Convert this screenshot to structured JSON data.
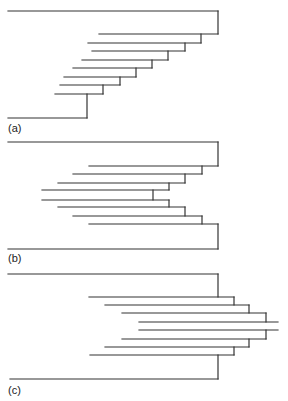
{
  "figure": {
    "stroke_color": "#333333",
    "stroke_width": 1.2,
    "panels": [
      {
        "id": "a",
        "label": "(a)",
        "label_pos": [
          8,
          122
        ],
        "description": "Staircase (pectinate) tree: all branches step down to the left",
        "segments": [
          [
            8,
            11,
            218,
            11
          ],
          [
            218,
            11,
            218,
            34
          ],
          [
            99,
            34,
            218,
            34
          ],
          [
            201,
            34,
            201,
            43
          ],
          [
            88,
            43,
            201,
            43
          ],
          [
            185,
            43,
            185,
            51
          ],
          [
            92,
            51,
            185,
            51
          ],
          [
            168,
            51,
            168,
            60
          ],
          [
            82,
            60,
            168,
            60
          ],
          [
            152,
            60,
            152,
            68
          ],
          [
            73,
            68,
            152,
            68
          ],
          [
            136,
            68,
            136,
            77
          ],
          [
            64,
            77,
            136,
            77
          ],
          [
            120,
            77,
            120,
            85
          ],
          [
            60,
            85,
            120,
            85
          ],
          [
            103,
            85,
            103,
            94
          ],
          [
            55,
            94,
            103,
            94
          ],
          [
            87,
            94,
            87,
            118
          ],
          [
            8,
            118,
            87,
            118
          ]
        ]
      },
      {
        "id": "b",
        "label": "(b)",
        "label_pos": [
          8,
          252
        ],
        "description": "Symmetric tree: branches step inward toward the center on the left",
        "segments": [
          [
            8,
            142,
            218,
            142
          ],
          [
            218,
            142,
            218,
            166
          ],
          [
            89,
            166,
            218,
            166
          ],
          [
            202,
            166,
            202,
            174
          ],
          [
            73,
            174,
            202,
            174
          ],
          [
            185,
            174,
            185,
            183
          ],
          [
            58,
            183,
            185,
            183
          ],
          [
            169,
            183,
            169,
            190
          ],
          [
            42,
            190,
            169,
            190
          ],
          [
            153,
            190,
            153,
            200
          ],
          [
            42,
            200,
            169,
            200
          ],
          [
            169,
            200,
            169,
            207
          ],
          [
            58,
            207,
            185,
            207
          ],
          [
            185,
            207,
            185,
            216
          ],
          [
            73,
            216,
            202,
            216
          ],
          [
            202,
            216,
            202,
            224
          ],
          [
            89,
            224,
            218,
            224
          ],
          [
            218,
            224,
            218,
            249
          ],
          [
            8,
            249,
            218,
            249
          ]
        ]
      },
      {
        "id": "c",
        "label": "(c)",
        "label_pos": [
          8,
          384
        ],
        "description": "Symmetric tree: branches step outward to the right toward the center",
        "segments": [
          [
            8,
            274,
            218,
            274
          ],
          [
            218,
            274,
            218,
            297
          ],
          [
            89,
            297,
            234,
            297
          ],
          [
            234,
            297,
            234,
            305
          ],
          [
            105,
            305,
            249,
            305
          ],
          [
            249,
            305,
            249,
            313
          ],
          [
            122,
            313,
            266,
            313
          ],
          [
            266,
            313,
            266,
            322
          ],
          [
            139,
            322,
            278,
            322
          ],
          [
            139,
            330,
            278,
            330
          ],
          [
            266,
            330,
            266,
            339
          ],
          [
            122,
            339,
            266,
            339
          ],
          [
            249,
            339,
            249,
            347
          ],
          [
            105,
            347,
            249,
            347
          ],
          [
            234,
            347,
            234,
            355
          ],
          [
            90,
            355,
            234,
            355
          ],
          [
            218,
            355,
            218,
            379
          ],
          [
            10,
            379,
            218,
            379
          ]
        ]
      }
    ]
  }
}
